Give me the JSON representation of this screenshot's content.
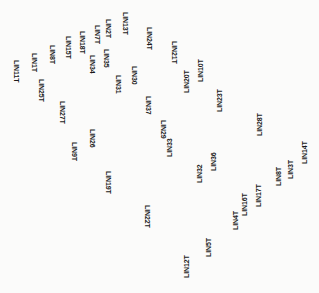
{
  "diagram": {
    "type": "scanned-label-map",
    "labels": [
      {
        "id": "LIN11T",
        "text": "LIN11T",
        "x": 20,
        "y": 60,
        "dir": "down"
      },
      {
        "id": "LIN1T",
        "text": "LIN1T",
        "x": 38,
        "y": 53,
        "dir": "down"
      },
      {
        "id": "LIN25T",
        "text": "LIN25T",
        "x": 45,
        "y": 79,
        "dir": "down"
      },
      {
        "id": "LIN8T_a",
        "text": "LIN8T",
        "x": 56,
        "y": 45,
        "dir": "down"
      },
      {
        "id": "LIN15T",
        "text": "LIN15T",
        "x": 72,
        "y": 36,
        "dir": "down"
      },
      {
        "id": "LIN18T",
        "text": "LIN18T",
        "x": 86,
        "y": 31,
        "dir": "down"
      },
      {
        "id": "LIN7T",
        "text": "LIN7T",
        "x": 101,
        "y": 25,
        "dir": "down"
      },
      {
        "id": "LIN2T",
        "text": "LIN2T",
        "x": 112,
        "y": 19,
        "dir": "down"
      },
      {
        "id": "LIN13T",
        "text": "LIN13T",
        "x": 129,
        "y": 12,
        "dir": "down"
      },
      {
        "id": "LIN24T",
        "text": "LIN24T",
        "x": 153,
        "y": 27,
        "dir": "down"
      },
      {
        "id": "LIN34",
        "text": "LIN34",
        "x": 96,
        "y": 55,
        "dir": "down"
      },
      {
        "id": "LIN35",
        "text": "LIN35",
        "x": 110,
        "y": 49,
        "dir": "down"
      },
      {
        "id": "LIN30",
        "text": "LIN30",
        "x": 138,
        "y": 66,
        "dir": "down"
      },
      {
        "id": "LIN31",
        "text": "LIN31",
        "x": 122,
        "y": 75,
        "dir": "down"
      },
      {
        "id": "LIN37",
        "text": "LIN37",
        "x": 152,
        "y": 96,
        "dir": "down"
      },
      {
        "id": "LIN27T",
        "text": "LIN27T",
        "x": 66,
        "y": 101,
        "dir": "down"
      },
      {
        "id": "LIN26",
        "text": "LIN26",
        "x": 96,
        "y": 129,
        "dir": "down"
      },
      {
        "id": "LIN9T",
        "text": "LIN9T",
        "x": 78,
        "y": 142,
        "dir": "down"
      },
      {
        "id": "LIN19T",
        "text": "LIN19T",
        "x": 112,
        "y": 171,
        "dir": "down"
      },
      {
        "id": "LIN22T",
        "text": "LIN22T",
        "x": 151,
        "y": 205,
        "dir": "down"
      },
      {
        "id": "LIN21T",
        "text": "LIN21T",
        "x": 178,
        "y": 41,
        "dir": "down"
      },
      {
        "id": "LIN20T",
        "text": "LIN20T",
        "x": 183,
        "y": 93,
        "dir": "up"
      },
      {
        "id": "LIN10T",
        "text": "LIN10T",
        "x": 197,
        "y": 82,
        "dir": "up"
      },
      {
        "id": "LIN23T",
        "text": "LIN23T",
        "x": 216,
        "y": 112,
        "dir": "up"
      },
      {
        "id": "LIN28T",
        "text": "LIN28T",
        "x": 256,
        "y": 136,
        "dir": "up"
      },
      {
        "id": "LIN29",
        "text": "LIN29",
        "x": 167,
        "y": 120,
        "dir": "down"
      },
      {
        "id": "LIN33",
        "text": "LIN33",
        "x": 166,
        "y": 157,
        "dir": "up"
      },
      {
        "id": "LIN32",
        "text": "LIN32",
        "x": 196,
        "y": 183,
        "dir": "up"
      },
      {
        "id": "LIN36",
        "text": "LIN36",
        "x": 210,
        "y": 171,
        "dir": "up"
      },
      {
        "id": "LIN17T",
        "text": "LIN17T",
        "x": 255,
        "y": 207,
        "dir": "up"
      },
      {
        "id": "LIN16T",
        "text": "LIN16T",
        "x": 241,
        "y": 216,
        "dir": "up"
      },
      {
        "id": "LIN4T",
        "text": "LIN4T",
        "x": 232,
        "y": 230,
        "dir": "up"
      },
      {
        "id": "LIN8T_b",
        "text": "LIN8T",
        "x": 275,
        "y": 186,
        "dir": "up"
      },
      {
        "id": "LIN3T",
        "text": "LIN3T",
        "x": 287,
        "y": 179,
        "dir": "up"
      },
      {
        "id": "LIN14T",
        "text": "LIN14T",
        "x": 301,
        "y": 164,
        "dir": "up"
      },
      {
        "id": "LIN5T",
        "text": "LIN5T",
        "x": 205,
        "y": 257,
        "dir": "up"
      },
      {
        "id": "LIN12T",
        "text": "LIN12T",
        "x": 183,
        "y": 278,
        "dir": "up"
      }
    ]
  },
  "colors": {
    "background": "#fbfbfa",
    "text": "#1a1a1a"
  }
}
